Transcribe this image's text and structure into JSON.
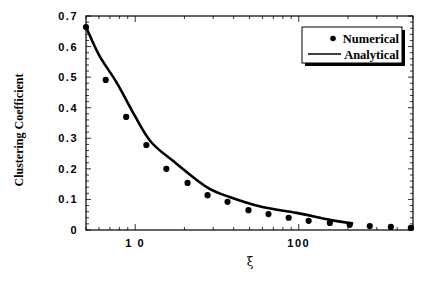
{
  "chart_data": {
    "type": "scatter",
    "title": "",
    "xlabel": "ξ",
    "ylabel": "Clustering Coefficient",
    "xscale": "log",
    "xlim": [
      5,
      500
    ],
    "ylim": [
      0,
      0.7
    ],
    "grid": false,
    "x_ticks": [
      {
        "value": 10,
        "label": "1 0"
      },
      {
        "value": 100,
        "label": "100"
      }
    ],
    "y_ticks": [
      {
        "value": 0,
        "label": "0"
      },
      {
        "value": 0.1,
        "label": "0.1"
      },
      {
        "value": 0.2,
        "label": "0.2"
      },
      {
        "value": 0.3,
        "label": "0.3"
      },
      {
        "value": 0.4,
        "label": "0.4"
      },
      {
        "value": 0.5,
        "label": "0.5"
      },
      {
        "value": 0.6,
        "label": "0.6"
      },
      {
        "value": 0.7,
        "label": "0.7"
      }
    ],
    "legend": {
      "position": "top-right",
      "entries": [
        {
          "label": "Numerical",
          "marker": "dot"
        },
        {
          "label": "Analytical",
          "marker": "line"
        }
      ]
    },
    "series": [
      {
        "name": "Numerical",
        "kind": "scatter",
        "color": "#000000",
        "x": [
          5.0,
          6.6,
          8.8,
          11.7,
          15.5,
          20.9,
          27.7,
          36.7,
          49.3,
          65.3,
          86.8,
          115,
          155,
          205,
          272,
          366,
          485
        ],
        "y": [
          0.664,
          0.491,
          0.37,
          0.278,
          0.2,
          0.154,
          0.114,
          0.092,
          0.065,
          0.052,
          0.04,
          0.03,
          0.023,
          0.017,
          0.013,
          0.01,
          0.007
        ]
      },
      {
        "name": "Analytical",
        "kind": "line",
        "color": "#000000",
        "x": [
          5.0,
          6.0,
          7.75,
          9.86,
          12.5,
          17.4,
          27.2,
          37.7,
          60,
          97,
          155,
          215
        ],
        "y": [
          0.664,
          0.573,
          0.48,
          0.377,
          0.288,
          0.222,
          0.141,
          0.108,
          0.075,
          0.056,
          0.033,
          0.021
        ]
      }
    ]
  }
}
